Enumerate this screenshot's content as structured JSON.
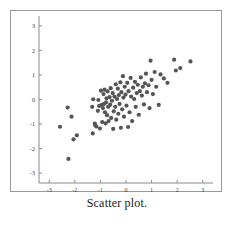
{
  "figure": {
    "caption": "Scatter plot.",
    "background_color": "#ffffff",
    "frame_color": "#9a9a9a"
  },
  "chart_data": {
    "type": "scatter",
    "title": "",
    "subtitle": "",
    "xlabel": "",
    "ylabel": "",
    "xlim": [
      -3.4,
      3.4
    ],
    "ylim": [
      -3.4,
      3.4
    ],
    "xticks": [
      -3,
      -2,
      -1,
      0,
      1,
      2,
      3
    ],
    "yticks": [
      -3,
      -2,
      -1,
      0,
      1,
      2,
      3
    ],
    "xtick_labels": [
      "-3",
      "-2",
      "-1",
      "0",
      "1",
      "2",
      "3"
    ],
    "ytick_labels": [
      "-3",
      "-2",
      "-1",
      "0",
      "1",
      "2",
      "3"
    ],
    "grid": false,
    "legend": null,
    "legend_position": "none",
    "marker": "circle",
    "marker_color": "#555555",
    "marker_size": 2.1,
    "n_points": 95,
    "correlation_approx": 0.75,
    "annotations": [],
    "points": [
      [
        -2.58,
        -1.11
      ],
      [
        -2.28,
        -0.33
      ],
      [
        -2.25,
        -2.42
      ],
      [
        -2.13,
        -0.7
      ],
      [
        -2.05,
        -1.62
      ],
      [
        -1.92,
        -1.46
      ],
      [
        -1.32,
        -0.3
      ],
      [
        -1.3,
        -1.38
      ],
      [
        -1.28,
        0.01
      ],
      [
        -1.22,
        -0.98
      ],
      [
        -1.2,
        -1.05
      ],
      [
        -1.16,
        -1.1
      ],
      [
        -1.1,
        -0.46
      ],
      [
        -1.08,
        -0.02
      ],
      [
        -1.05,
        -0.26
      ],
      [
        -1.02,
        -1.18
      ],
      [
        -0.98,
        0.36
      ],
      [
        -0.95,
        -0.22
      ],
      [
        -0.93,
        -0.92
      ],
      [
        -0.9,
        -0.35
      ],
      [
        -0.88,
        0.22
      ],
      [
        -0.86,
        -0.18
      ],
      [
        -0.84,
        0.4
      ],
      [
        -0.82,
        -0.52
      ],
      [
        -0.8,
        -0.97
      ],
      [
        -0.78,
        -0.12
      ],
      [
        -0.76,
        0.05
      ],
      [
        -0.74,
        -0.64
      ],
      [
        -0.72,
        0.33
      ],
      [
        -0.7,
        -0.3
      ],
      [
        -0.68,
        -0.88
      ],
      [
        -0.64,
        0.1
      ],
      [
        -0.62,
        -0.21
      ],
      [
        -0.6,
        0.46
      ],
      [
        -0.58,
        -0.75
      ],
      [
        -0.55,
        -0.05
      ],
      [
        -0.52,
        0.26
      ],
      [
        -0.5,
        -1.2
      ],
      [
        -0.48,
        -0.48
      ],
      [
        -0.45,
        0.12
      ],
      [
        -0.42,
        -0.3
      ],
      [
        -0.4,
        0.62
      ],
      [
        -0.38,
        -0.82
      ],
      [
        -0.35,
        0.02
      ],
      [
        -0.32,
        0.44
      ],
      [
        -0.3,
        -0.58
      ],
      [
        -0.28,
        0.18
      ],
      [
        -0.25,
        -0.18
      ],
      [
        -0.22,
        0.7
      ],
      [
        -0.2,
        -1.15
      ],
      [
        -0.18,
        0.3
      ],
      [
        -0.15,
        -0.4
      ],
      [
        -0.12,
        0.95
      ],
      [
        -0.1,
        0.08
      ],
      [
        -0.08,
        -0.7
      ],
      [
        -0.05,
        0.52
      ],
      [
        -0.02,
        0.2
      ],
      [
        0.02,
        -0.25
      ],
      [
        0.05,
        0.68
      ],
      [
        0.08,
        -1.12
      ],
      [
        0.1,
        0.34
      ],
      [
        0.14,
        -0.52
      ],
      [
        0.18,
        0.88
      ],
      [
        0.2,
        0.12
      ],
      [
        0.24,
        -0.88
      ],
      [
        0.28,
        0.48
      ],
      [
        0.32,
        0.02
      ],
      [
        0.35,
        0.72
      ],
      [
        0.38,
        -0.3
      ],
      [
        0.42,
        0.26
      ],
      [
        0.46,
        0.6
      ],
      [
        0.5,
        -0.62
      ],
      [
        0.54,
        0.34
      ],
      [
        0.58,
        0.9
      ],
      [
        0.62,
        0.16
      ],
      [
        0.66,
        0.52
      ],
      [
        0.7,
        -0.2
      ],
      [
        0.74,
        0.66
      ],
      [
        0.78,
        1.05
      ],
      [
        0.82,
        0.3
      ],
      [
        0.88,
        0.58
      ],
      [
        0.92,
        -0.35
      ],
      [
        0.96,
        1.58
      ],
      [
        1.0,
        0.8
      ],
      [
        1.05,
        0.22
      ],
      [
        1.12,
        1.12
      ],
      [
        1.18,
        0.52
      ],
      [
        1.28,
        -0.22
      ],
      [
        1.35,
        1.02
      ],
      [
        1.48,
        0.86
      ],
      [
        1.62,
        0.68
      ],
      [
        1.88,
        1.62
      ],
      [
        1.95,
        1.18
      ],
      [
        2.12,
        1.28
      ],
      [
        2.52,
        1.55
      ]
    ]
  }
}
